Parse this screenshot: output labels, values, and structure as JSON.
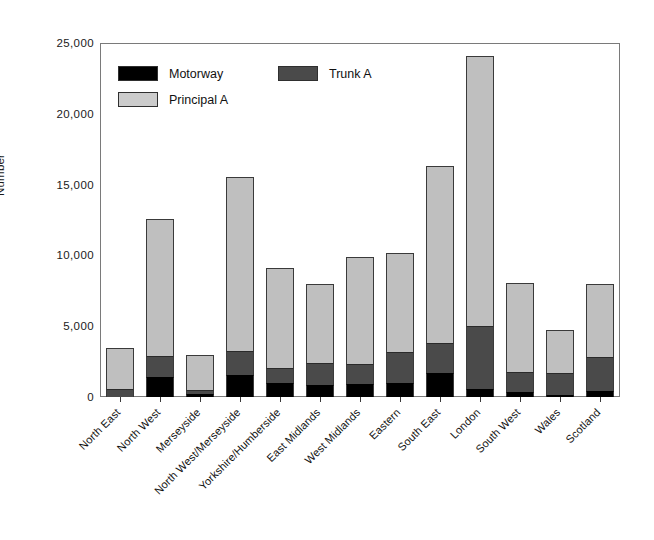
{
  "chart_data": {
    "type": "bar",
    "stacked": true,
    "title": "",
    "xlabel": "",
    "ylabel": "Number",
    "ylim": [
      0,
      25000
    ],
    "yticks": [
      0,
      5000,
      10000,
      15000,
      20000,
      25000
    ],
    "ytick_labels": [
      "0",
      "5,000",
      "10,000",
      "15,000",
      "20,000",
      "25,000"
    ],
    "grid": false,
    "legend_position": "upper-left-inside",
    "categories": [
      "North East",
      "North West",
      "Merseyside",
      "North West/Merseyside",
      "Yorkshire/Humberside",
      "East Midlands",
      "West Midlands",
      "Eastern",
      "South East",
      "London",
      "South West",
      "Wales",
      "Scotland"
    ],
    "series": [
      {
        "name": "Motorway",
        "color": "#000000",
        "values": [
          0,
          1410,
          200,
          1560,
          990,
          850,
          920,
          1000,
          1700,
          560,
          350,
          120,
          450
        ]
      },
      {
        "name": "Trunk A",
        "color": "#4a4a4a",
        "values": [
          560,
          1490,
          330,
          1690,
          1060,
          1550,
          1410,
          2180,
          2110,
          4450,
          1420,
          1580,
          2370
        ]
      },
      {
        "name": "Principal A",
        "color": "#bfbfbf",
        "values": [
          2900,
          9670,
          2440,
          12290,
          7060,
          5580,
          7560,
          6990,
          12510,
          19090,
          6280,
          3030,
          5160
        ]
      }
    ],
    "totals": [
      3460,
      12570,
      2970,
      15540,
      9110,
      7980,
      9890,
      10170,
      16320,
      24100,
      8050,
      4730,
      7980
    ]
  },
  "legend": {
    "items": [
      {
        "label": "Motorway",
        "swatch": "black-swatch-icon"
      },
      {
        "label": "Trunk A",
        "swatch": "dark-gray-swatch-icon"
      },
      {
        "label": "Principal A",
        "swatch": "light-gray-swatch-icon"
      }
    ]
  }
}
